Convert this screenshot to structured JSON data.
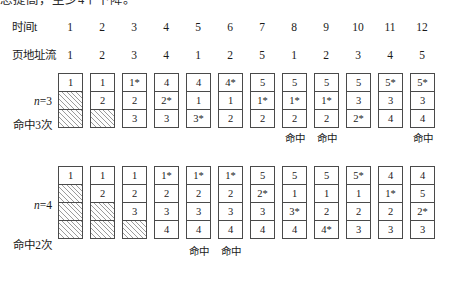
{
  "clipped_top_line": "总提高，至少4个下降。",
  "header": {
    "time_label": "时间t",
    "time_values": [
      "1",
      "2",
      "3",
      "4",
      "5",
      "6",
      "7",
      "8",
      "9",
      "10",
      "11",
      "12"
    ],
    "page_stream_label": "页地址流",
    "page_stream_values": [
      "1",
      "2",
      "3",
      "4",
      "1",
      "2",
      "5",
      "1",
      "2",
      "3",
      "4",
      "5"
    ]
  },
  "sections": [
    {
      "id": "n3",
      "frames_label": "n=3",
      "frames_label_prefix": "n",
      "frames_label_suffix": "=3",
      "hit_count_label": "命中3次",
      "hit_marker": "命中",
      "frame_count": 3,
      "columns": [
        {
          "t": "1",
          "cells": [
            {
              "v": "1",
              "star": false,
              "empty": false
            },
            {
              "v": "",
              "star": false,
              "empty": true
            },
            {
              "v": "",
              "star": false,
              "empty": true
            }
          ],
          "hit": false
        },
        {
          "t": "2",
          "cells": [
            {
              "v": "1",
              "star": false,
              "empty": false
            },
            {
              "v": "2",
              "star": false,
              "empty": false
            },
            {
              "v": "",
              "star": false,
              "empty": true
            }
          ],
          "hit": false
        },
        {
          "t": "3",
          "cells": [
            {
              "v": "1",
              "star": true,
              "empty": false
            },
            {
              "v": "2",
              "star": false,
              "empty": false
            },
            {
              "v": "3",
              "star": false,
              "empty": false
            }
          ],
          "hit": false
        },
        {
          "t": "4",
          "cells": [
            {
              "v": "4",
              "star": false,
              "empty": false
            },
            {
              "v": "2",
              "star": true,
              "empty": false
            },
            {
              "v": "3",
              "star": false,
              "empty": false
            }
          ],
          "hit": false
        },
        {
          "t": "5",
          "cells": [
            {
              "v": "4",
              "star": false,
              "empty": false
            },
            {
              "v": "1",
              "star": false,
              "empty": false
            },
            {
              "v": "3",
              "star": true,
              "empty": false
            }
          ],
          "hit": false
        },
        {
          "t": "6",
          "cells": [
            {
              "v": "4",
              "star": true,
              "empty": false
            },
            {
              "v": "1",
              "star": false,
              "empty": false
            },
            {
              "v": "2",
              "star": false,
              "empty": false
            }
          ],
          "hit": false
        },
        {
          "t": "7",
          "cells": [
            {
              "v": "5",
              "star": false,
              "empty": false
            },
            {
              "v": "1",
              "star": true,
              "empty": false
            },
            {
              "v": "2",
              "star": false,
              "empty": false
            }
          ],
          "hit": false
        },
        {
          "t": "8",
          "cells": [
            {
              "v": "5",
              "star": false,
              "empty": false
            },
            {
              "v": "1",
              "star": true,
              "empty": false
            },
            {
              "v": "2",
              "star": false,
              "empty": false
            }
          ],
          "hit": true
        },
        {
          "t": "9",
          "cells": [
            {
              "v": "5",
              "star": false,
              "empty": false
            },
            {
              "v": "1",
              "star": true,
              "empty": false
            },
            {
              "v": "2",
              "star": false,
              "empty": false
            }
          ],
          "hit": true
        },
        {
          "t": "10",
          "cells": [
            {
              "v": "5",
              "star": false,
              "empty": false
            },
            {
              "v": "3",
              "star": false,
              "empty": false
            },
            {
              "v": "2",
              "star": true,
              "empty": false
            }
          ],
          "hit": false
        },
        {
          "t": "11",
          "cells": [
            {
              "v": "5",
              "star": true,
              "empty": false
            },
            {
              "v": "3",
              "star": false,
              "empty": false
            },
            {
              "v": "4",
              "star": false,
              "empty": false
            }
          ],
          "hit": false
        },
        {
          "t": "12",
          "cells": [
            {
              "v": "5",
              "star": true,
              "empty": false
            },
            {
              "v": "3",
              "star": false,
              "empty": false
            },
            {
              "v": "4",
              "star": false,
              "empty": false
            }
          ],
          "hit": true
        }
      ]
    },
    {
      "id": "n4",
      "frames_label": "n=4",
      "frames_label_prefix": "n",
      "frames_label_suffix": "=4",
      "hit_count_label": "命中2次",
      "hit_marker": "命中",
      "frame_count": 4,
      "columns": [
        {
          "t": "1",
          "cells": [
            {
              "v": "1",
              "star": false,
              "empty": false
            },
            {
              "v": "",
              "star": false,
              "empty": true
            },
            {
              "v": "",
              "star": false,
              "empty": true
            },
            {
              "v": "",
              "star": false,
              "empty": true
            }
          ],
          "hit": false
        },
        {
          "t": "2",
          "cells": [
            {
              "v": "1",
              "star": false,
              "empty": false
            },
            {
              "v": "2",
              "star": false,
              "empty": false
            },
            {
              "v": "",
              "star": false,
              "empty": true
            },
            {
              "v": "",
              "star": false,
              "empty": true
            }
          ],
          "hit": false
        },
        {
          "t": "3",
          "cells": [
            {
              "v": "1",
              "star": false,
              "empty": false
            },
            {
              "v": "2",
              "star": false,
              "empty": false
            },
            {
              "v": "3",
              "star": false,
              "empty": false
            },
            {
              "v": "",
              "star": false,
              "empty": true
            }
          ],
          "hit": false
        },
        {
          "t": "4",
          "cells": [
            {
              "v": "1",
              "star": true,
              "empty": false
            },
            {
              "v": "2",
              "star": false,
              "empty": false
            },
            {
              "v": "3",
              "star": false,
              "empty": false
            },
            {
              "v": "4",
              "star": false,
              "empty": false
            }
          ],
          "hit": false
        },
        {
          "t": "5",
          "cells": [
            {
              "v": "1",
              "star": true,
              "empty": false
            },
            {
              "v": "2",
              "star": false,
              "empty": false
            },
            {
              "v": "3",
              "star": false,
              "empty": false
            },
            {
              "v": "4",
              "star": false,
              "empty": false
            }
          ],
          "hit": true
        },
        {
          "t": "6",
          "cells": [
            {
              "v": "1",
              "star": true,
              "empty": false
            },
            {
              "v": "2",
              "star": false,
              "empty": false
            },
            {
              "v": "3",
              "star": false,
              "empty": false
            },
            {
              "v": "4",
              "star": false,
              "empty": false
            }
          ],
          "hit": true
        },
        {
          "t": "7",
          "cells": [
            {
              "v": "5",
              "star": false,
              "empty": false
            },
            {
              "v": "2",
              "star": true,
              "empty": false
            },
            {
              "v": "3",
              "star": false,
              "empty": false
            },
            {
              "v": "4",
              "star": false,
              "empty": false
            }
          ],
          "hit": false
        },
        {
          "t": "8",
          "cells": [
            {
              "v": "5",
              "star": false,
              "empty": false
            },
            {
              "v": "1",
              "star": false,
              "empty": false
            },
            {
              "v": "3",
              "star": true,
              "empty": false
            },
            {
              "v": "4",
              "star": false,
              "empty": false
            }
          ],
          "hit": false
        },
        {
          "t": "9",
          "cells": [
            {
              "v": "5",
              "star": false,
              "empty": false
            },
            {
              "v": "1",
              "star": false,
              "empty": false
            },
            {
              "v": "2",
              "star": false,
              "empty": false
            },
            {
              "v": "4",
              "star": true,
              "empty": false
            }
          ],
          "hit": false
        },
        {
          "t": "10",
          "cells": [
            {
              "v": "5",
              "star": true,
              "empty": false
            },
            {
              "v": "1",
              "star": false,
              "empty": false
            },
            {
              "v": "2",
              "star": false,
              "empty": false
            },
            {
              "v": "3",
              "star": false,
              "empty": false
            }
          ],
          "hit": false
        },
        {
          "t": "11",
          "cells": [
            {
              "v": "4",
              "star": false,
              "empty": false
            },
            {
              "v": "1",
              "star": true,
              "empty": false
            },
            {
              "v": "2",
              "star": false,
              "empty": false
            },
            {
              "v": "3",
              "star": false,
              "empty": false
            }
          ],
          "hit": false
        },
        {
          "t": "12",
          "cells": [
            {
              "v": "4",
              "star": false,
              "empty": false
            },
            {
              "v": "5",
              "star": false,
              "empty": false
            },
            {
              "v": "2",
              "star": true,
              "empty": false
            },
            {
              "v": "3",
              "star": false,
              "empty": false
            }
          ],
          "hit": false
        }
      ]
    }
  ],
  "layout": {
    "col_x": [
      58,
      90,
      122,
      154,
      186,
      218,
      250,
      282,
      314,
      346,
      378,
      410
    ]
  }
}
